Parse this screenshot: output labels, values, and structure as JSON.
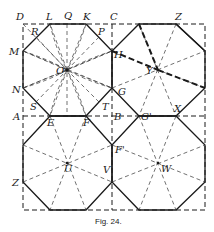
{
  "figure": {
    "caption": "Fig. 24.",
    "labels": {
      "D": "D",
      "L": "L",
      "Q": "Q",
      "K": "K",
      "C": "C",
      "Z_top": "Z",
      "R": "R",
      "P": "P",
      "M": "M",
      "H": "H",
      "O": "O",
      "Y": "Y",
      "N": "N",
      "S": "S",
      "T": "T",
      "G": "G",
      "A": "A",
      "E": "E",
      "F": "F",
      "B": "B",
      "G_prime": "G'",
      "X": "X",
      "F_prime": "F'",
      "Z_left": "Z",
      "U": "U",
      "V": "V",
      "W": "W"
    }
  }
}
